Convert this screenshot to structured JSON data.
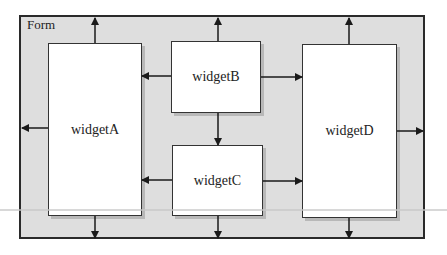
{
  "diagram": {
    "form": {
      "label": "Form"
    },
    "widgets": [
      {
        "id": "widgetA",
        "label": "widgetA"
      },
      {
        "id": "widgetB",
        "label": "widgetB"
      },
      {
        "id": "widgetC",
        "label": "widgetC"
      },
      {
        "id": "widgetD",
        "label": "widgetD"
      }
    ],
    "colors": {
      "form_fill": "#dedede",
      "widget_fill": "#ffffff",
      "stroke": "#2a2a2a"
    }
  }
}
